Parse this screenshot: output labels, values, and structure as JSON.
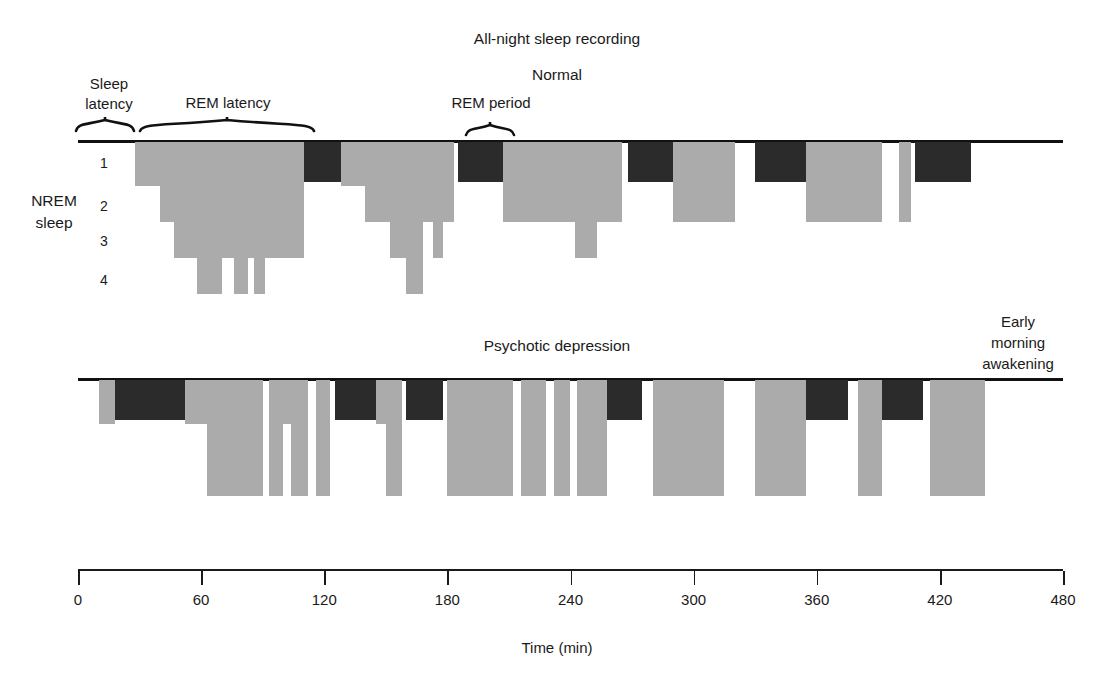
{
  "figure": {
    "faded_top_text": "",
    "title": "All-night sleep recording",
    "xaxis_title": "Time (min)",
    "y_axis_group_label": "NREM\nsleep",
    "y_axis_group_label_line1": "NREM",
    "y_axis_group_label_line2": "sleep",
    "stage_labels": [
      "1",
      "2",
      "3",
      "4"
    ],
    "colors": {
      "nrem_gray": "#ababab",
      "rem_dark": "#2b2b2b",
      "axis": "#1a1a1a",
      "background": "#ffffff"
    }
  },
  "annotations": {
    "sleep_latency": "Sleep\nlatency",
    "sleep_latency_line1": "Sleep",
    "sleep_latency_line2": "latency",
    "rem_latency": "REM latency",
    "normal": "Normal",
    "rem_period": "REM period",
    "psychotic_depression": "Psychotic depression",
    "early_morning_awakening_line1": "Early",
    "early_morning_awakening_line2": "morning",
    "early_morning_awakening_line3": "awakening"
  },
  "chart_data": {
    "type": "area",
    "title": "All-night sleep recording",
    "xlabel": "Time (min)",
    "ylabel": "NREM sleep",
    "xlim": [
      0,
      480
    ],
    "ylim": [
      0,
      4
    ],
    "xticks": [
      0,
      60,
      120,
      180,
      240,
      300,
      360,
      420,
      480
    ],
    "ytick_labels": [
      "1",
      "2",
      "3",
      "4"
    ],
    "grid": false,
    "legend": null,
    "stage_encoding": {
      "awake": 0,
      "nrem1": 1,
      "nrem2": 2,
      "nrem3": 3,
      "nrem4": 4,
      "rem": "dark block at stage 1 depth"
    },
    "series": [
      {
        "name": "Normal",
        "panel": 1,
        "sleep_latency_min": [
          0,
          28
        ],
        "rem_latency_min": [
          28,
          110
        ],
        "segments": [
          {
            "start": 28,
            "end": 40,
            "stage": 1,
            "type": "nrem"
          },
          {
            "start": 40,
            "end": 47,
            "stage": 2,
            "type": "nrem"
          },
          {
            "start": 47,
            "end": 58,
            "stage": 3,
            "type": "nrem"
          },
          {
            "start": 58,
            "end": 70,
            "stage": 4,
            "type": "nrem"
          },
          {
            "start": 70,
            "end": 76,
            "stage": 3,
            "type": "nrem"
          },
          {
            "start": 76,
            "end": 83,
            "stage": 4,
            "type": "nrem"
          },
          {
            "start": 83,
            "end": 86,
            "stage": 3,
            "type": "nrem"
          },
          {
            "start": 86,
            "end": 91,
            "stage": 4,
            "type": "nrem"
          },
          {
            "start": 91,
            "end": 110,
            "stage": 3,
            "type": "nrem"
          },
          {
            "start": 110,
            "end": 128,
            "stage": 1,
            "type": "rem"
          },
          {
            "start": 128,
            "end": 140,
            "stage": 1,
            "type": "nrem"
          },
          {
            "start": 140,
            "end": 152,
            "stage": 2,
            "type": "nrem"
          },
          {
            "start": 152,
            "end": 160,
            "stage": 3,
            "type": "nrem"
          },
          {
            "start": 160,
            "end": 168,
            "stage": 4,
            "type": "nrem"
          },
          {
            "start": 168,
            "end": 173,
            "stage": 2,
            "type": "nrem"
          },
          {
            "start": 173,
            "end": 178,
            "stage": 3,
            "type": "nrem"
          },
          {
            "start": 178,
            "end": 183,
            "stage": 2,
            "type": "nrem"
          },
          {
            "start": 185,
            "end": 207,
            "stage": 1,
            "type": "rem"
          },
          {
            "start": 207,
            "end": 230,
            "stage": 2,
            "type": "nrem"
          },
          {
            "start": 230,
            "end": 242,
            "stage": 2,
            "type": "nrem"
          },
          {
            "start": 242,
            "end": 253,
            "stage": 3,
            "type": "nrem"
          },
          {
            "start": 253,
            "end": 265,
            "stage": 2,
            "type": "nrem"
          },
          {
            "start": 268,
            "end": 290,
            "stage": 1,
            "type": "rem"
          },
          {
            "start": 290,
            "end": 320,
            "stage": 2,
            "type": "nrem"
          },
          {
            "start": 330,
            "end": 355,
            "stage": 1,
            "type": "rem"
          },
          {
            "start": 355,
            "end": 392,
            "stage": 2,
            "type": "nrem"
          },
          {
            "start": 400,
            "end": 406,
            "stage": 2,
            "type": "nrem"
          },
          {
            "start": 408,
            "end": 435,
            "stage": 1,
            "type": "rem"
          }
        ]
      },
      {
        "name": "Psychotic depression",
        "panel": 2,
        "segments": [
          {
            "start": 10,
            "end": 18,
            "stage": 1,
            "type": "nrem"
          },
          {
            "start": 18,
            "end": 52,
            "stage": 1,
            "type": "rem"
          },
          {
            "start": 52,
            "end": 63,
            "stage": 1,
            "type": "nrem"
          },
          {
            "start": 63,
            "end": 90,
            "stage": 3,
            "type": "nrem"
          },
          {
            "start": 93,
            "end": 100,
            "stage": 3,
            "type": "nrem"
          },
          {
            "start": 100,
            "end": 104,
            "stage": 1,
            "type": "nrem"
          },
          {
            "start": 104,
            "end": 112,
            "stage": 3,
            "type": "nrem"
          },
          {
            "start": 116,
            "end": 123,
            "stage": 3,
            "type": "nrem"
          },
          {
            "start": 125,
            "end": 145,
            "stage": 1,
            "type": "rem"
          },
          {
            "start": 145,
            "end": 150,
            "stage": 1,
            "type": "nrem"
          },
          {
            "start": 150,
            "end": 158,
            "stage": 3,
            "type": "nrem"
          },
          {
            "start": 160,
            "end": 178,
            "stage": 1,
            "type": "rem"
          },
          {
            "start": 180,
            "end": 212,
            "stage": 3,
            "type": "nrem"
          },
          {
            "start": 216,
            "end": 228,
            "stage": 3,
            "type": "nrem"
          },
          {
            "start": 232,
            "end": 240,
            "stage": 3,
            "type": "nrem"
          },
          {
            "start": 243,
            "end": 258,
            "stage": 3,
            "type": "nrem"
          },
          {
            "start": 258,
            "end": 275,
            "stage": 1,
            "type": "rem"
          },
          {
            "start": 280,
            "end": 315,
            "stage": 3,
            "type": "nrem"
          },
          {
            "start": 330,
            "end": 355,
            "stage": 3,
            "type": "nrem"
          },
          {
            "start": 355,
            "end": 375,
            "stage": 1,
            "type": "rem"
          },
          {
            "start": 380,
            "end": 392,
            "stage": 3,
            "type": "nrem"
          },
          {
            "start": 392,
            "end": 412,
            "stage": 1,
            "type": "rem"
          },
          {
            "start": 415,
            "end": 442,
            "stage": 3,
            "type": "nrem"
          }
        ],
        "early_morning_awakening_min": 442
      }
    ]
  }
}
